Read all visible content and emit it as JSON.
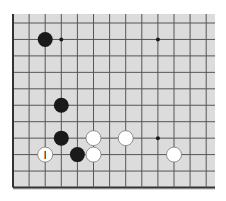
{
  "game": "go",
  "board_view": {
    "columns": 13,
    "rows": 11,
    "edges": {
      "left": true,
      "bottom": true,
      "top": false,
      "right": false
    }
  },
  "colors": {
    "board": "#dcdcdc",
    "line": "#555555",
    "edge_line": "#333333",
    "black_stone": "#1a1a1a",
    "white_stone": "#ffffff",
    "white_stone_outline": "#777777",
    "star_point": "#1a1a1a"
  },
  "star_points": [
    {
      "col": 3,
      "row": 1
    },
    {
      "col": 9,
      "row": 1
    },
    {
      "col": 9,
      "row": 7
    }
  ],
  "stones": [
    {
      "color": "black",
      "col": 2,
      "row": 1,
      "label": ""
    },
    {
      "color": "black",
      "col": 3,
      "row": 5,
      "label": ""
    },
    {
      "color": "black",
      "col": 3,
      "row": 7,
      "label": ""
    },
    {
      "color": "white",
      "col": 5,
      "row": 7,
      "label": ""
    },
    {
      "color": "white",
      "col": 7,
      "row": 7,
      "label": ""
    },
    {
      "color": "white",
      "col": 2,
      "row": 8,
      "label": "I"
    },
    {
      "color": "black",
      "col": 4,
      "row": 8,
      "label": ""
    },
    {
      "color": "white",
      "col": 5,
      "row": 8,
      "label": ""
    },
    {
      "color": "white",
      "col": 10,
      "row": 8,
      "label": ""
    }
  ]
}
